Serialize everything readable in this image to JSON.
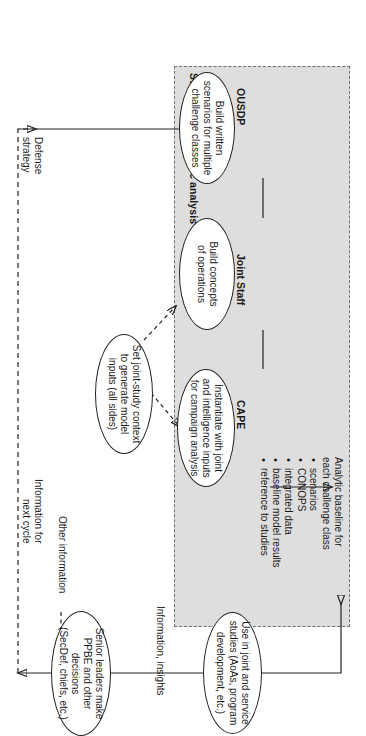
{
  "figure": {
    "orientation": "landscape-rotated-90cw",
    "boundary": {
      "label": "Support for strategic analysis",
      "style": "dashed",
      "fill": "#dedede"
    },
    "lanes": [
      {
        "id": "ousdp",
        "label": "OUSDP"
      },
      {
        "id": "joint-staff",
        "label": "Joint Staff"
      },
      {
        "id": "cape",
        "label": "CAPE"
      }
    ],
    "note": {
      "heading_line1": "Analytic baseline for",
      "heading_line2": "each challenge class",
      "bullets": [
        "scenarios",
        "CONOPS",
        "integrated data",
        "baseline model results",
        "reference to studies"
      ]
    },
    "nodes": [
      {
        "id": "ousdp-node",
        "lane": "ousdp",
        "lines": [
          "Build written",
          "scenarios for multiple",
          "challenge classes"
        ]
      },
      {
        "id": "joint-staff-node",
        "lane": "joint-staff",
        "lines": [
          "Build concepts",
          "of operations"
        ]
      },
      {
        "id": "cape-node",
        "lane": "cape",
        "lines": [
          "Instantiate with joint",
          "and intelligence inputs",
          "for campaign analysis"
        ]
      },
      {
        "id": "joint-study-node",
        "lane": "",
        "lines": [
          "Set joint-study context",
          "to generate model",
          "inputs (all sides)"
        ]
      },
      {
        "id": "studies-node",
        "lane": "",
        "lines": [
          "Use in joint and service",
          "studies (AoAs, program",
          "development, etc.)"
        ]
      },
      {
        "id": "leaders-node",
        "lane": "",
        "lines": [
          "Senior leaders make",
          "PPBE and other decisions",
          "(SecDef, chiefs, etc.)"
        ]
      }
    ],
    "edge_labels": [
      {
        "id": "info-insights",
        "lines": [
          "Information, insights"
        ]
      },
      {
        "id": "info-next-cycle",
        "lines": [
          "Information for",
          "next cycle"
        ]
      },
      {
        "id": "defense-strategy",
        "lines": [
          "Defense",
          "strategy"
        ]
      },
      {
        "id": "other-information",
        "lines": [
          "Other information"
        ]
      }
    ]
  }
}
